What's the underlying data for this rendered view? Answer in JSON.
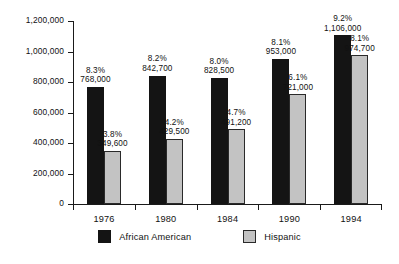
{
  "chart_data": {
    "type": "bar",
    "title": "",
    "subtitle": "",
    "xlabel": "",
    "ylabel": "",
    "categories": [
      "1976",
      "1980",
      "1984",
      "1990",
      "1994"
    ],
    "ylim": [
      0,
      1200000
    ],
    "yticks": [
      0,
      200000,
      400000,
      600000,
      800000,
      1000000,
      1200000
    ],
    "ytick_labels": [
      "0",
      "200,000",
      "400,000",
      "600,000",
      "800,000",
      "1,000,000",
      "1,200,000"
    ],
    "grid": false,
    "legend_position": "bottom",
    "series": [
      {
        "name": "African American",
        "color": "#141414",
        "values": [
          768000,
          842700,
          828500,
          953000,
          1106000
        ],
        "value_labels": [
          "768,000",
          "842,700",
          "828,500",
          "953,000",
          "1,106,000"
        ],
        "percent_labels": [
          "8.3%",
          "8.2%",
          "8.0%",
          "8.1%",
          "9.2%"
        ]
      },
      {
        "name": "Hispanic",
        "color": "#c3c3c3",
        "values": [
          349600,
          429500,
          491200,
          721000,
          974700
        ],
        "value_labels": [
          "349,600",
          "429,500",
          "491,200",
          "721,000",
          "974,700"
        ],
        "percent_labels": [
          "3.8%",
          "4.2%",
          "4.7%",
          "6.1%",
          "8.1%"
        ]
      }
    ]
  },
  "legend": {
    "items": [
      {
        "label": "African American",
        "swatch": "black-square-swatch"
      },
      {
        "label": "Hispanic",
        "swatch": "gray-square-swatch"
      }
    ]
  }
}
